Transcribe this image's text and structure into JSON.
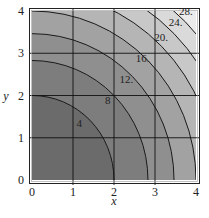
{
  "chart_data": {
    "type": "contour",
    "title": "",
    "function_hint": "x^2 + y^2",
    "xlabel": "x",
    "ylabel": "y",
    "xlim": [
      0,
      4
    ],
    "ylim": [
      0,
      4
    ],
    "xticks": [
      "0",
      "1",
      "2",
      "3",
      "4"
    ],
    "yticks": [
      "0",
      "1",
      "2",
      "3",
      "4"
    ],
    "grid": true,
    "levels": [
      4,
      8,
      12,
      16,
      20,
      24,
      28
    ],
    "level_labels": [
      "4",
      "8",
      "12.",
      "16.",
      "20.",
      "24.",
      "28."
    ],
    "label_positions": [
      {
        "label": "4",
        "x": 1.15,
        "y": 1.25
      },
      {
        "label": "8",
        "x": 1.85,
        "y": 1.8
      },
      {
        "label": "12.",
        "x": 2.3,
        "y": 2.3
      },
      {
        "label": "16.",
        "x": 2.7,
        "y": 2.8
      },
      {
        "label": "20.",
        "x": 3.15,
        "y": 3.3
      },
      {
        "label": "24.",
        "x": 3.5,
        "y": 3.65
      },
      {
        "label": "28.",
        "x": 3.75,
        "y": 3.9
      }
    ],
    "fill_colors": [
      "#6b6b6b",
      "#7d7d7d",
      "#8f8f8f",
      "#a2a2a2",
      "#b5b5b5",
      "#c8c8c8",
      "#dadada",
      "#ebebeb"
    ]
  }
}
